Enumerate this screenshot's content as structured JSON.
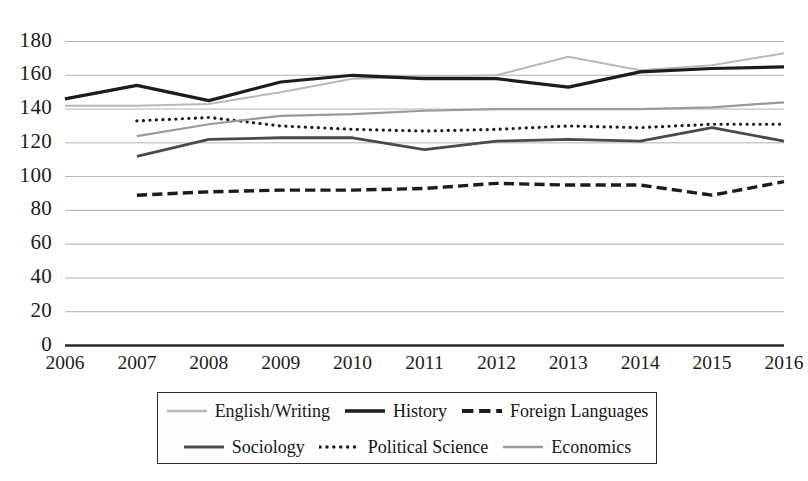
{
  "chart_data": {
    "type": "line",
    "title": "",
    "xlabel": "",
    "ylabel": "",
    "categories": [
      "2006",
      "2007",
      "2008",
      "2009",
      "2010",
      "2011",
      "2012",
      "2013",
      "2014",
      "2015",
      "2016"
    ],
    "x": [
      2006,
      2007,
      2008,
      2009,
      2010,
      2011,
      2012,
      2013,
      2014,
      2015,
      2016
    ],
    "ylim": [
      0,
      180
    ],
    "xlim": [
      2006,
      2016
    ],
    "ytick_labels": [
      "0",
      "20",
      "40",
      "60",
      "80",
      "100",
      "120",
      "140",
      "160",
      "180"
    ],
    "ytick_values": [
      0,
      20,
      40,
      60,
      80,
      100,
      120,
      140,
      160,
      180
    ],
    "grid": true,
    "grid_axis": "y",
    "legend_position": "bottom",
    "series": [
      {
        "name": "English/Writing",
        "color": "#b9b9b9",
        "style": "solid",
        "width": 2.0,
        "x": [
          2006,
          2007,
          2008,
          2009,
          2010,
          2011,
          2012,
          2013,
          2014,
          2015,
          2016
        ],
        "values": [
          142,
          142,
          143,
          150,
          158,
          159,
          160,
          171,
          163,
          166,
          173
        ]
      },
      {
        "name": "History",
        "color": "#1c1c1c",
        "style": "solid",
        "width": 3.2,
        "x": [
          2006,
          2007,
          2008,
          2009,
          2010,
          2011,
          2012,
          2013,
          2014,
          2015,
          2016
        ],
        "values": [
          146,
          154,
          145,
          156,
          160,
          158,
          158,
          153,
          162,
          164,
          165
        ]
      },
      {
        "name": "Foreign Languages",
        "color": "#1c1c1c",
        "style": "dashed",
        "width": 3.4,
        "x": [
          2007,
          2008,
          2009,
          2010,
          2011,
          2012,
          2013,
          2014,
          2015,
          2016
        ],
        "values": [
          89,
          91,
          92,
          92,
          93,
          96,
          95,
          95,
          89,
          97
        ]
      },
      {
        "name": "Sociology",
        "color": "#4a4a4a",
        "style": "solid",
        "width": 2.8,
        "x": [
          2007,
          2008,
          2009,
          2010,
          2011,
          2012,
          2013,
          2014,
          2015,
          2016
        ],
        "values": [
          112,
          122,
          123,
          123,
          116,
          121,
          122,
          121,
          129,
          121
        ]
      },
      {
        "name": "Political Science",
        "color": "#1c1c1c",
        "style": "dotted",
        "width": 3.2,
        "x": [
          2007,
          2008,
          2009,
          2010,
          2011,
          2012,
          2013,
          2014,
          2015,
          2016
        ],
        "values": [
          133,
          135,
          130,
          128,
          127,
          128,
          130,
          129,
          131,
          131
        ]
      },
      {
        "name": "Economics",
        "color": "#9a9a9a",
        "style": "solid",
        "width": 2.2,
        "x": [
          2007,
          2008,
          2009,
          2010,
          2011,
          2012,
          2013,
          2014,
          2015,
          2016
        ],
        "values": [
          124,
          131,
          136,
          137,
          139,
          140,
          140,
          140,
          141,
          144
        ]
      }
    ]
  },
  "legend": {
    "rows": [
      [
        {
          "label": "English/Writing",
          "style": "solid",
          "color": "#b9b9b9",
          "width": 2.4
        },
        {
          "label": "History",
          "style": "solid",
          "color": "#1c1c1c",
          "width": 3.6
        },
        {
          "label": "Foreign Languages",
          "style": "dashed",
          "color": "#1c1c1c",
          "width": 3.8
        }
      ],
      [
        {
          "label": "Sociology",
          "style": "solid",
          "color": "#4a4a4a",
          "width": 3.2
        },
        {
          "label": "Political Science",
          "style": "dotted",
          "color": "#1c1c1c",
          "width": 3.4
        },
        {
          "label": "Economics",
          "style": "solid",
          "color": "#9a9a9a",
          "width": 2.6
        }
      ]
    ]
  },
  "axis": {
    "y_labels": [
      "180",
      "160",
      "140",
      "120",
      "100",
      "80",
      "60",
      "40",
      "20",
      "0"
    ],
    "x_labels": [
      "2006",
      "2007",
      "2008",
      "2009",
      "2010",
      "2011",
      "2012",
      "2013",
      "2014",
      "2015",
      "2016"
    ]
  }
}
